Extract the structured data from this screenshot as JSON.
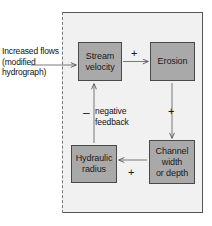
{
  "diagram": {
    "panel": {
      "background_color": "#f1f1f1",
      "border_color": "#555555",
      "dashed_edge": "left"
    },
    "node_fill_color": "#a9a9a9",
    "node_border_color": "#4a4a4a",
    "external_input": {
      "lines": [
        "Increased",
        "flows",
        "(modified",
        "hydrograph)"
      ]
    },
    "nodes": [
      {
        "id": "stream-velocity",
        "lines": [
          "Stream",
          "velocity"
        ]
      },
      {
        "id": "erosion",
        "lines": [
          "Erosion"
        ]
      },
      {
        "id": "hydraulic-radius",
        "lines": [
          "Hydraulic",
          "radius"
        ]
      },
      {
        "id": "channel-width",
        "lines": [
          "Channel",
          "width",
          "or depth"
        ]
      }
    ],
    "annotations": {
      "plus_stream_to_erosion": "+",
      "plus_erosion_to_channel": "+",
      "plus_channel_to_hydraulic": "+",
      "minus_hydraulic_to_stream": "–",
      "feedback_lines": [
        "negative",
        "feedback"
      ]
    }
  }
}
